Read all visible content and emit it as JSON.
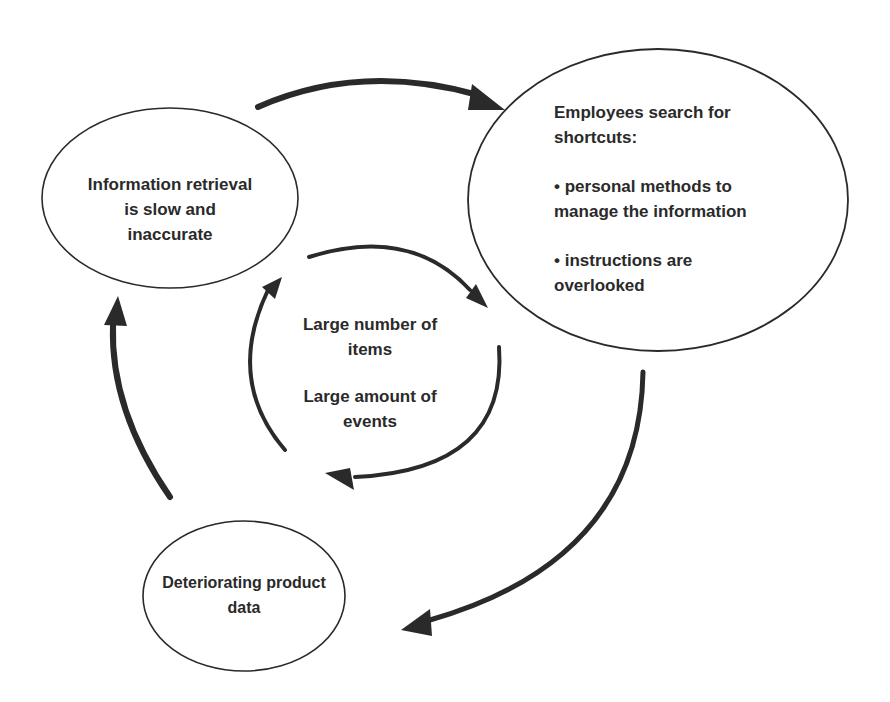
{
  "diagram": {
    "type": "cycle",
    "nodes": {
      "info_retrieval": {
        "text": "Information retrieval is slow and inaccurate",
        "lines": [
          "Information retrieval",
          "is slow and",
          "inaccurate"
        ]
      },
      "employees_shortcuts": {
        "title_lines": [
          "Employees search for",
          "shortcuts:"
        ],
        "bullets": [
          {
            "lines": [
              "• personal methods to",
              "manage the information"
            ]
          },
          {
            "lines": [
              "• instructions are",
              "overlooked"
            ]
          }
        ]
      },
      "inner_cycle": {
        "item1_lines": [
          "Large number of",
          "items"
        ],
        "item2_lines": [
          "Large amount of",
          "events"
        ]
      },
      "deteriorating_data": {
        "text": "Deteriorating product data",
        "lines": [
          "Deteriorating product",
          "data"
        ]
      }
    },
    "edges": [
      {
        "from": "info_retrieval",
        "to": "employees_shortcuts"
      },
      {
        "from": "employees_shortcuts",
        "to": "deteriorating_data"
      },
      {
        "from": "deteriorating_data",
        "to": "info_retrieval"
      },
      {
        "from": "inner_cycle",
        "to": "inner_cycle",
        "note": "circular arrows around center"
      }
    ],
    "colors": {
      "stroke": "#2a2a2a",
      "text": "#2a2a2a",
      "background": "#ffffff"
    }
  }
}
